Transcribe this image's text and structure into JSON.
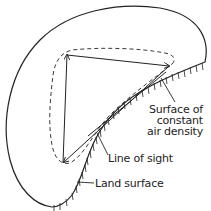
{
  "diagram": {
    "labels": {
      "surface_line1": "Surface of",
      "surface_line2": "constant",
      "surface_line3": "air density",
      "line_of_sight": "Line of sight",
      "land_surface": "Land surface"
    },
    "elements": [
      "outer-boundary",
      "land-surface-hatched-edge",
      "dashed-constant-density-surface",
      "line-of-sight-triangle"
    ],
    "colors": {
      "stroke": "#222222",
      "background": "#ffffff"
    }
  }
}
